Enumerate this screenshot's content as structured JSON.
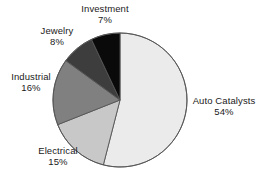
{
  "chart_data": {
    "type": "pie",
    "title": "",
    "subtitle": "",
    "xlabel": "",
    "ylabel": "",
    "legend_position": "none",
    "grid": false,
    "labels_outside": true,
    "units": "percent",
    "categories": [
      "Auto Catalysts",
      "Electrical",
      "Industrial",
      "Jewelry",
      "Investment"
    ],
    "values": [
      54,
      15,
      16,
      8,
      7
    ],
    "slices": [
      {
        "name": "Auto Catalysts",
        "label": "Auto Catalysts",
        "value": 54,
        "pct_text": "54%",
        "color": "#ebebeb",
        "start_angle_deg": 0,
        "sweep_deg": 194.4
      },
      {
        "name": "Electrical",
        "label": "Electrical",
        "value": 15,
        "pct_text": "15%",
        "color": "#c8c8c8",
        "start_angle_deg": 194.4,
        "sweep_deg": 54.0
      },
      {
        "name": "Industrial",
        "label": "Industrial",
        "value": 16,
        "pct_text": "16%",
        "color": "#808080",
        "start_angle_deg": 248.4,
        "sweep_deg": 57.6
      },
      {
        "name": "Jewelry",
        "label": "Jewelry",
        "value": 8,
        "pct_text": "8%",
        "color": "#3d3d3d",
        "start_angle_deg": 306.0,
        "sweep_deg": 28.8
      },
      {
        "name": "Investment",
        "label": "Investment",
        "value": 7,
        "pct_text": "7%",
        "color": "#0a0a0a",
        "start_angle_deg": 334.8,
        "sweep_deg": 25.2
      }
    ],
    "geometry": {
      "cx": 120,
      "cy": 100,
      "r": 67,
      "outline_color": "#555555",
      "outline_width": 0.9,
      "background": "#ffffff"
    }
  }
}
